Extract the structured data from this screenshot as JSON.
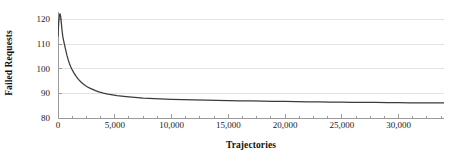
{
  "chart_data": {
    "type": "line",
    "title": "",
    "xlabel": "Trajectories",
    "ylabel": "Failed Requests",
    "xlim": [
      0,
      34000
    ],
    "ylim": [
      80,
      123
    ],
    "grid": true,
    "grid_axis": "y",
    "legend": false,
    "legend_position": "none",
    "line_color": "#3b3b3b",
    "grid_color": "#e3e3e3",
    "axis_color": "#9a9a9a",
    "x_ticks": [
      0,
      5000,
      10000,
      15000,
      20000,
      25000,
      30000
    ],
    "x_tick_labels": [
      "0",
      "5,000",
      "10,000",
      "15,000",
      "20,000",
      "25,000",
      "30,000"
    ],
    "x_minor_tick_interval": 1250,
    "y_ticks": [
      80,
      90,
      100,
      110,
      120
    ],
    "y_tick_labels": [
      "80",
      "90",
      "100",
      "110",
      "120"
    ],
    "series": [
      {
        "name": "Failed Requests",
        "x": [
          0,
          60,
          120,
          180,
          240,
          300,
          360,
          420,
          500,
          600,
          700,
          800,
          900,
          1000,
          1100,
          1200,
          1400,
          1600,
          1800,
          2000,
          2200,
          2400,
          2600,
          2800,
          3000,
          3300,
          3600,
          4000,
          4400,
          4800,
          5200,
          5600,
          6000,
          6500,
          7000,
          7500,
          8000,
          8500,
          9000,
          9500,
          10000,
          11000,
          12000,
          13000,
          14000,
          15000,
          16000,
          17000,
          18000,
          19000,
          20000,
          21000,
          22000,
          23000,
          24000,
          25000,
          26000,
          27000,
          28000,
          29000,
          30000,
          31000,
          32000,
          33000,
          34000
        ],
        "y": [
          113.2,
          118.4,
          121.6,
          122.3,
          121.0,
          118.2,
          115.4,
          113.1,
          111.3,
          109.2,
          107.1,
          105.2,
          103.6,
          102.2,
          101.0,
          100.0,
          98.3,
          96.9,
          95.7,
          94.7,
          93.9,
          93.2,
          92.6,
          92.1,
          91.7,
          91.1,
          90.6,
          90.1,
          89.7,
          89.4,
          89.1,
          88.9,
          88.7,
          88.5,
          88.3,
          88.1,
          88.0,
          87.9,
          87.8,
          87.7,
          87.6,
          87.45,
          87.35,
          87.25,
          87.15,
          87.05,
          86.97,
          86.9,
          86.83,
          86.77,
          86.7,
          86.64,
          86.58,
          86.53,
          86.48,
          86.43,
          86.38,
          86.34,
          86.3,
          86.26,
          86.22,
          86.18,
          86.15,
          86.12,
          86.1
        ]
      }
    ]
  }
}
